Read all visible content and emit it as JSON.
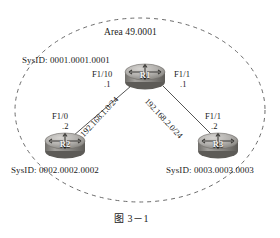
{
  "figure": {
    "caption": "图 3－1",
    "area_label": "Area 49.0001"
  },
  "colors": {
    "line": "#555555",
    "dashed_boundary": "#6b6b6b",
    "text": "#1a1a1a",
    "router_body_light": "#b9b7b4",
    "router_body_mid": "#8f8d8a",
    "router_body_dark": "#5e5c59",
    "router_top_light": "#cfcdca",
    "router_arrow": "#3a3936",
    "background": "#ffffff"
  },
  "routers": [
    {
      "id": "r1",
      "name": "R1",
      "sysid_label": "SysID:  0001.0001.0001",
      "interfaces": [
        {
          "name": "F1/10",
          "address_suffix": ".1"
        },
        {
          "name": "F1/1",
          "address_suffix": ".1"
        }
      ]
    },
    {
      "id": "r2",
      "name": "R2",
      "sysid_label": "SysID:  0002.0002.0002",
      "interfaces": [
        {
          "name": "F1/0",
          "address_suffix": ".2"
        }
      ]
    },
    {
      "id": "r3",
      "name": "R3",
      "sysid_label": "SysID:  0003.0003.0003",
      "interfaces": [
        {
          "name": "F1/1",
          "address_suffix": ".2"
        }
      ]
    }
  ],
  "links": [
    {
      "id": "link-r1-r2",
      "network": "192.168.1.0/24",
      "from": "R1",
      "to": "R2"
    },
    {
      "id": "link-r1-r3",
      "network": "192.168.2.0/24",
      "from": "R1",
      "to": "R3"
    }
  ]
}
